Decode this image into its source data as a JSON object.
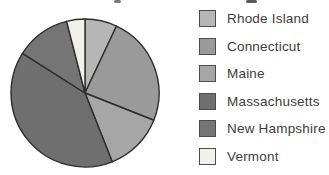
{
  "chart_data": {
    "type": "pie",
    "title": "",
    "legend_position": "right",
    "direction": "clockwise",
    "start_angle_deg": 0,
    "outline_color": "#2e2e2e",
    "slices": [
      {
        "label": "Rhode Island",
        "value": 7,
        "color": "#b6b6b6"
      },
      {
        "label": "Connecticut",
        "value": 24,
        "color": "#9a9a9a"
      },
      {
        "label": "Maine",
        "value": 13,
        "color": "#a6a6a6"
      },
      {
        "label": "Massachusetts",
        "value": 40,
        "color": "#6f6f6f"
      },
      {
        "label": "New Hampshire",
        "value": 12,
        "color": "#757575"
      },
      {
        "label": "Vermont",
        "value": 4,
        "color": "#f1f0ec"
      }
    ]
  }
}
